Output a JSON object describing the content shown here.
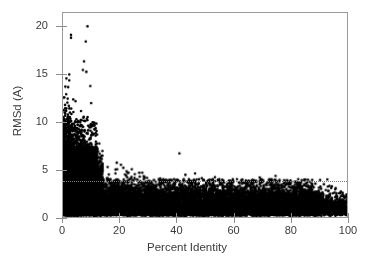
{
  "figure": {
    "background": "#ffffff",
    "frame_color": "#9a9a9a",
    "marker_color": "#000000",
    "text_color": "#3b3b3b"
  },
  "chart_data": {
    "type": "scatter",
    "title": "",
    "xlabel": "Percent Identity",
    "ylabel": "RMSd (A)",
    "xlim": [
      0,
      100
    ],
    "ylim": [
      0,
      21.5
    ],
    "xticks": [
      0,
      20,
      40,
      60,
      80,
      100
    ],
    "yticks": [
      0,
      5,
      10,
      15,
      20
    ],
    "xticklabels": [
      "0",
      "20",
      "40",
      "60",
      "80",
      "100"
    ],
    "yticklabels": [
      "0",
      "5",
      "10",
      "15",
      "20"
    ],
    "grid": false,
    "legend": null,
    "marker": {
      "shape": "circle",
      "color": "#000000",
      "size_px": 2.6
    },
    "annotations": [
      {
        "type": "hline",
        "y": 4.0,
        "style": "dotted",
        "color": "#7d7d7d",
        "label": ""
      }
    ],
    "outliers": [
      {
        "x": 8.6,
        "y": 20.1
      },
      {
        "x": 2.8,
        "y": 19.2
      },
      {
        "x": 2.8,
        "y": 18.9
      },
      {
        "x": 8.0,
        "y": 18.5
      },
      {
        "x": 7.4,
        "y": 16.4
      },
      {
        "x": 7.0,
        "y": 15.5
      },
      {
        "x": 8.2,
        "y": 15.3
      },
      {
        "x": 1.2,
        "y": 14.6
      },
      {
        "x": 2.2,
        "y": 14.4
      },
      {
        "x": 9.6,
        "y": 13.8
      },
      {
        "x": 0.4,
        "y": 12.6
      },
      {
        "x": 3.6,
        "y": 12.4
      },
      {
        "x": 4.4,
        "y": 12.2
      },
      {
        "x": 9.9,
        "y": 12.0
      },
      {
        "x": 0.3,
        "y": 10.4
      },
      {
        "x": 41.0,
        "y": 6.7
      },
      {
        "x": 46.5,
        "y": 4.6
      },
      {
        "x": 53.5,
        "y": 4.2
      }
    ],
    "series": [
      {
        "name": "structure pairs",
        "n_points_approx": 9000,
        "x_range": [
          0,
          100
        ],
        "y_range": [
          0.1,
          20.1
        ]
      }
    ],
    "binned_profile": {
      "note": "approximate RMSd distribution per percent-identity bin (median / 90th percentile / max)",
      "bins": [
        "0-5",
        "5-10",
        "10-15",
        "15-20",
        "20-25",
        "25-30",
        "30-40",
        "40-50",
        "50-60",
        "60-70",
        "70-80",
        "80-90",
        "90-100"
      ],
      "median": [
        3.2,
        3.4,
        3.0,
        2.6,
        2.3,
        2.1,
        1.9,
        1.8,
        1.7,
        1.6,
        1.5,
        1.2,
        1.0
      ],
      "p90": [
        7.2,
        7.6,
        6.4,
        5.2,
        4.4,
        3.8,
        3.2,
        3.0,
        2.9,
        2.8,
        2.7,
        2.2,
        1.7
      ],
      "max": [
        14.6,
        20.1,
        13.8,
        8.6,
        6.2,
        5.4,
        4.6,
        6.7,
        4.6,
        4.0,
        3.6,
        3.2,
        2.0
      ]
    }
  }
}
